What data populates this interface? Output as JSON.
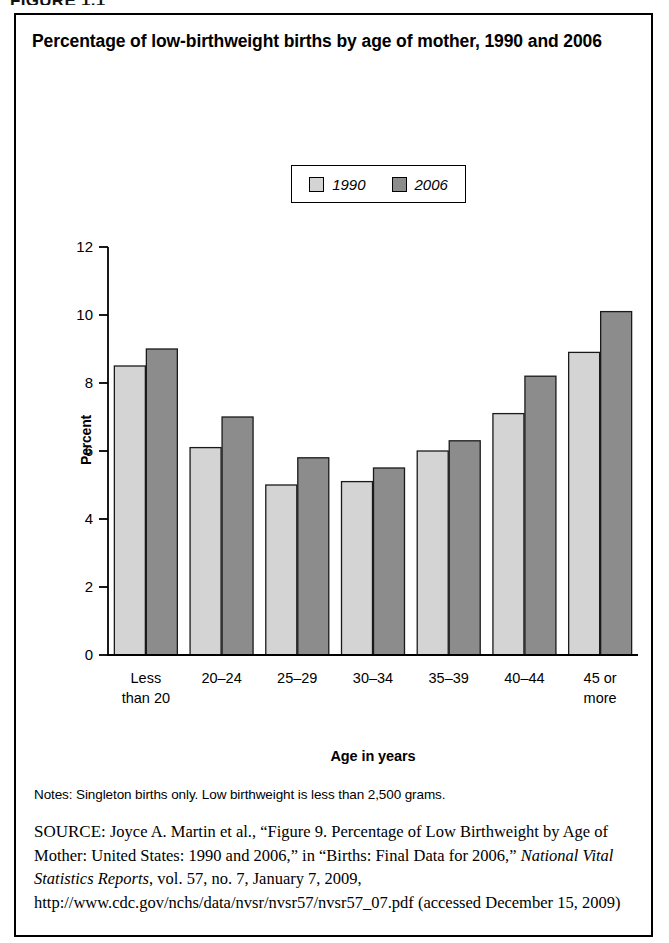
{
  "figure_heading": "FIGURE 1.1",
  "chart_title": "Percentage of low-birthweight births by age of mother, 1990 and 2006",
  "notes": "Notes: Singleton births only. Low birthweight is less than 2,500 grams.",
  "source": {
    "prefix": "SOURCE:",
    "part1": " Joyce A. Martin et al., “Figure 9. Percentage of Low Birthweight by Age of Mother: United States: 1990 and 2006,” in “Births: Final Data for 2006,” ",
    "italic": "National Vital Statistics Reports",
    "part2": ", vol. 57, no. 7, January 7, 2009, http://www.cdc.gov/nchs/data/nvsr/nvsr57/nvsr57_07.pdf (accessed December 15, 2009)"
  },
  "colors": {
    "series_1990": "#d4d4d4",
    "series_2006": "#8c8c8c",
    "axis": "#000000",
    "background": "#ffffff"
  },
  "chart_data": {
    "type": "bar",
    "title": "Percentage of low-birthweight births by age of mother, 1990 and 2006",
    "xlabel": "Age in years",
    "ylabel": "Percent",
    "ylim": [
      0,
      12
    ],
    "yticks": [
      0,
      2,
      4,
      6,
      8,
      10,
      12
    ],
    "ytick_labels": [
      "0",
      "2",
      "4",
      "6",
      "8",
      "10",
      "12"
    ],
    "grid": false,
    "legend_position": "top-center",
    "categories": [
      "Less\nthan 20",
      "20–24",
      "25–29",
      "30–34",
      "35–39",
      "40–44",
      "45 or\nmore"
    ],
    "series": [
      {
        "name": "1990",
        "color": "#d4d4d4",
        "values": [
          8.5,
          6.1,
          5.0,
          5.1,
          6.0,
          7.1,
          8.9
        ]
      },
      {
        "name": "2006",
        "color": "#8c8c8c",
        "values": [
          9.0,
          7.0,
          5.8,
          5.5,
          6.3,
          8.2,
          10.1
        ]
      }
    ]
  }
}
